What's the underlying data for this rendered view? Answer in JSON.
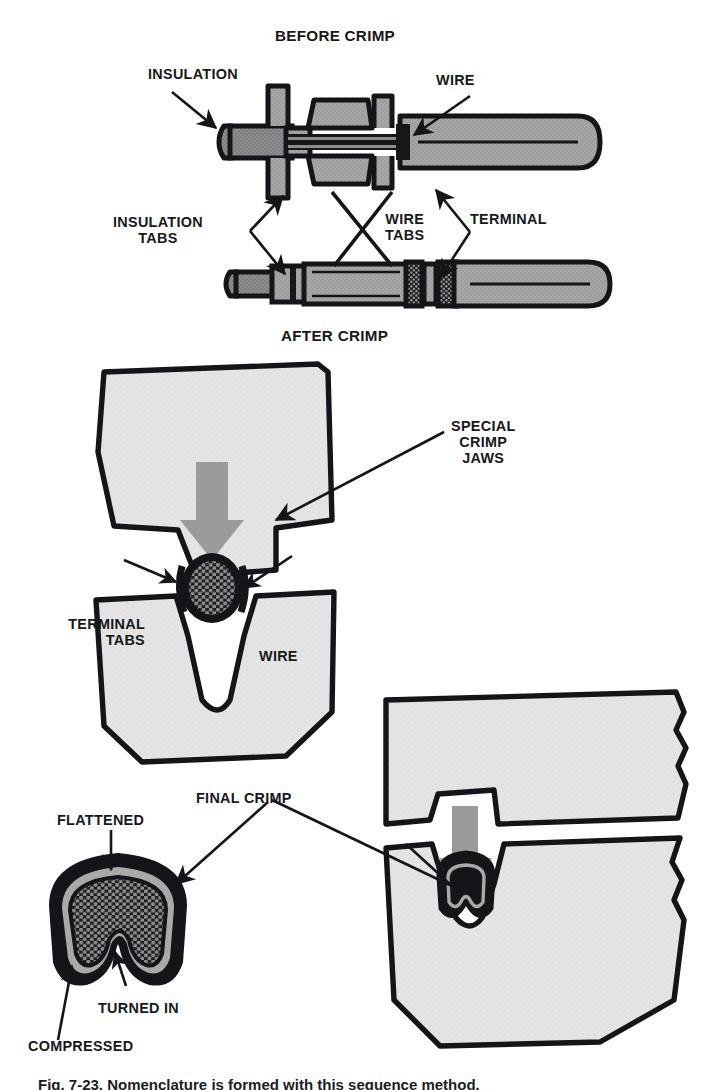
{
  "figure": {
    "kind": "technical-illustration",
    "caption": "Fig. 7-23.  Nomenclature is formed with this sequence method."
  },
  "palette": {
    "ink": "#141518",
    "paper": "#ffffff",
    "jaw_fill": "#e3e3e3",
    "metal_gray": "#a7a7a7",
    "metal_dark": "#8a8a8a",
    "arrow_gray": "#9a9a9a",
    "strand_fill": "#2a2a2a"
  },
  "panels": {
    "top": {
      "title_top": "BEFORE CRIMP",
      "title_bottom": "AFTER CRIMP",
      "labels": {
        "insulation": "INSULATION",
        "wire": "WIRE",
        "insulation_tabs": "INSULATION\nTABS",
        "wire_tabs": "WIRE\nTABS",
        "terminal": "TERMINAL"
      }
    },
    "middle": {
      "labels": {
        "special_crimp_jaws": "SPECIAL\nCRIMP\nJAWS",
        "terminal_tabs": "TERMINAL\nTABS",
        "wire": "WIRE"
      }
    },
    "bottom": {
      "labels": {
        "final_crimp": "FINAL CRIMP",
        "flattened": "FLATTENED",
        "turned_in": "TURNED IN",
        "compressed": "COMPRESSED"
      }
    }
  },
  "icons": {
    "press_arrow": "down-arrow-icon",
    "leader": "leader-line-icon",
    "pointer": "arrowhead-icon"
  }
}
